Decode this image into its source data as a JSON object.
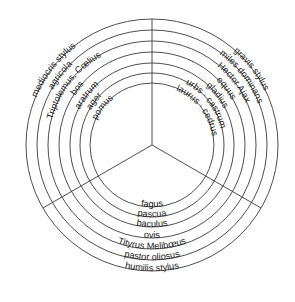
{
  "diagram": {
    "center": [
      152,
      145
    ],
    "radii": [
      62,
      72,
      82,
      93,
      104,
      115,
      126
    ],
    "colors": {
      "line": "#3a3a3a",
      "text": "#1a1a1a",
      "background": "#ffffff"
    },
    "sectors": {
      "left": {
        "style": "humilis",
        "labels_inner_to_outer": [
          "pomus",
          "ager",
          "aratrum",
          "bos",
          "Triptolemus, Cœlius",
          "agricola",
          "mediocris stylus"
        ]
      },
      "right": {
        "style": "gravis",
        "labels_inner_to_outer": [
          "laurus · cedrus",
          "urbs · castrum",
          "gladius",
          "equus",
          "Hector Ajax",
          "miles dominans",
          "gravis stylus"
        ]
      },
      "bottom": {
        "style": "mediocris",
        "labels_inner_to_outer": [
          "fagus",
          "pascua",
          "baculus",
          "ovis",
          "Tityrus Melibœus",
          "pastor oliosus",
          "humilis stylus"
        ]
      }
    }
  }
}
